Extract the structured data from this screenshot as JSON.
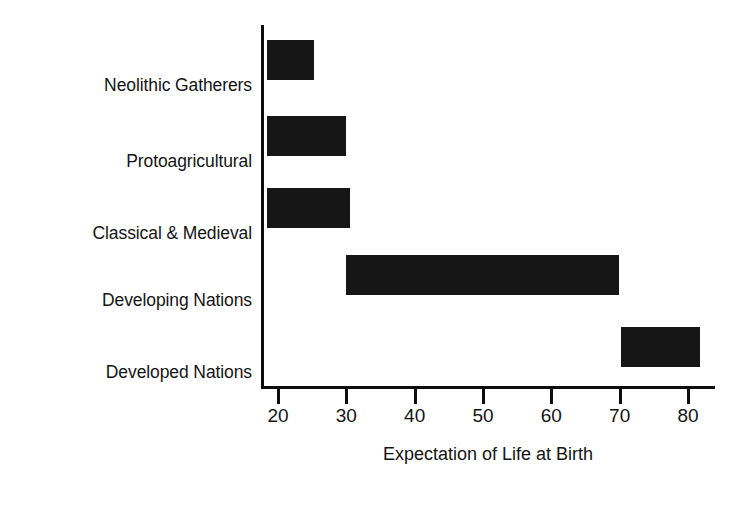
{
  "chart_data": {
    "type": "bar",
    "orientation": "horizontal",
    "subtype": "range-bar",
    "title": "",
    "xlabel": "Expectation of Life at Birth",
    "ylabel": "",
    "categories": [
      "Neolithic Gatherers",
      "Protoagricultural",
      "Classical & Medieval",
      "Developing Nations",
      "Developed Nations"
    ],
    "xticks": [
      20,
      30,
      40,
      50,
      60,
      70,
      80
    ],
    "xtick_labels": [
      "20",
      "30",
      "40",
      "50",
      "60",
      "70",
      "80"
    ],
    "xlim": [
      18.2,
      84.0
    ],
    "grid": false,
    "legend": null,
    "bar_color": "#161616",
    "axis_color": "#0d0d0d",
    "background": "#ffffff",
    "bars": [
      {
        "category": "Neolithic Gatherers",
        "start": 18.4,
        "end": 25.3,
        "value": 25.3
      },
      {
        "category": "Protoagricultural",
        "start": 18.4,
        "end": 29.9,
        "value": 29.9
      },
      {
        "category": "Classical & Medieval",
        "start": 18.4,
        "end": 30.6,
        "value": 30.6
      },
      {
        "category": "Developing Nations",
        "start": 30.0,
        "end": 69.9,
        "value": 69.9
      },
      {
        "category": "Developed Nations",
        "start": 70.2,
        "end": 81.7,
        "value": 81.7
      }
    ],
    "series": [
      {
        "name": "range start",
        "values": [
          18.4,
          18.4,
          18.4,
          30.0,
          70.2
        ]
      },
      {
        "name": "range end",
        "values": [
          25.3,
          29.9,
          30.6,
          69.9,
          81.7
        ]
      }
    ]
  }
}
